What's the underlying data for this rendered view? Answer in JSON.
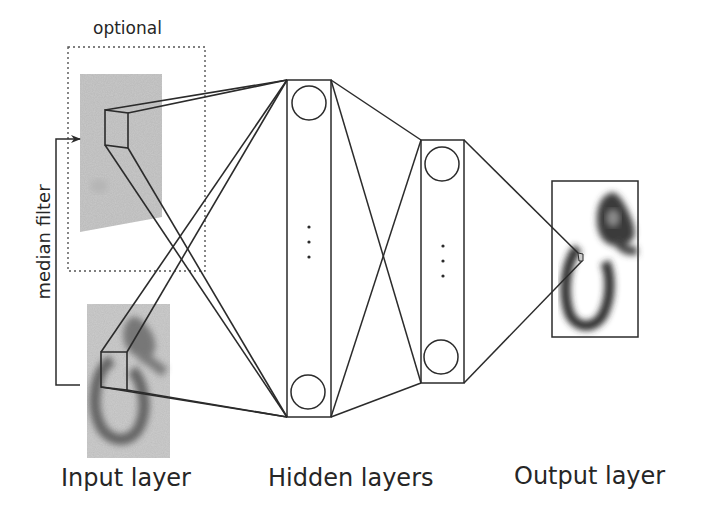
{
  "labels": {
    "optional": "optional",
    "median_filter": "median filter",
    "input_layer": "Input layer",
    "hidden_layers": "Hidden layers",
    "output_layer": "Output layer"
  },
  "colors": {
    "line": "#2b2b2b",
    "input_image_bg": "#c8c8c8",
    "digit_ink": "#3a3a3a",
    "background": "#ffffff"
  },
  "diagram": {
    "input_layer": {
      "optional_box": {
        "style": "dotted",
        "contains": "median-filtered input image"
      },
      "images": [
        "median-filtered digit image (optional)",
        "raw handwritten digit image"
      ],
      "connector": "median filter arrow from raw image to filtered image"
    },
    "hidden_layers": [
      {
        "units_shown": 2,
        "ellipsis": "⋮"
      },
      {
        "units_shown": 2,
        "ellipsis": "⋮"
      }
    ],
    "output_layer": {
      "content": "reconstructed handwritten digit image"
    }
  }
}
